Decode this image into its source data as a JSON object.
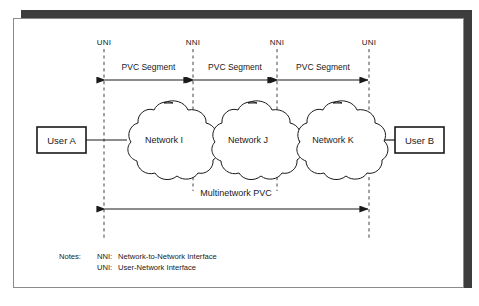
{
  "figure": {
    "title": "Multinetwork PVC",
    "interfaces": [
      {
        "label": "UNI",
        "x": 90
      },
      {
        "label": "NNI",
        "x": 179
      },
      {
        "label": "NNI",
        "x": 263
      },
      {
        "label": "UNI",
        "x": 355
      }
    ],
    "segments": [
      {
        "label": "PVC Segment"
      },
      {
        "label": "PVC Segment"
      },
      {
        "label": "PVC Segment"
      }
    ],
    "endpoints": [
      {
        "label": "User A"
      },
      {
        "label": "User B"
      }
    ],
    "clouds": [
      {
        "label": "Network I"
      },
      {
        "label": "Network J"
      },
      {
        "label": "Network K"
      }
    ],
    "span_label": "Multinetwork  PVC",
    "notes": {
      "heading": "Notes:",
      "entries": [
        {
          "term": "NNI:",
          "definition": "Network-to-Network Interface"
        },
        {
          "term": "UNI:",
          "definition": "User-Network Interface"
        }
      ]
    },
    "colors": {
      "line": "#1a1a1a",
      "text": "#1a1a1a",
      "panel_border": "#8a8a8a",
      "shadow": "#3d3d3d",
      "background": "#ffffff",
      "dashed": "#555555"
    }
  }
}
